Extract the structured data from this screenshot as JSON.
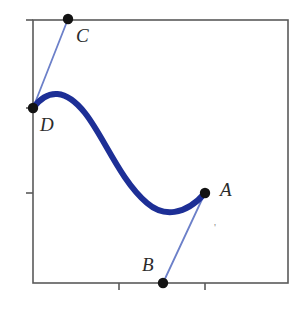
{
  "figure": {
    "background_color": "#ffffff",
    "width": 301,
    "height": 313
  },
  "frame": {
    "name": "plot-frame",
    "left": 33,
    "top": 20,
    "right": 288,
    "bottom": 283,
    "stroke_color": "#5a5a5a",
    "stroke_width": 1.6
  },
  "axes": {
    "y_axis": {
      "label": "",
      "tick_length": 7,
      "tick_color": "#5a5a5a",
      "ticks": [
        {
          "name": "y-tick-top",
          "y": 20,
          "label": ""
        },
        {
          "name": "y-tick-mid",
          "y": 108,
          "label": ""
        },
        {
          "name": "y-tick-low",
          "y": 193,
          "label": ""
        }
      ]
    },
    "x_axis": {
      "label": "",
      "tick_length": 7,
      "tick_color": "#5a5a5a",
      "ticks": [
        {
          "name": "x-tick-left",
          "x": 119,
          "label": ""
        },
        {
          "name": "x-tick-right",
          "x": 205,
          "label": ""
        }
      ]
    }
  },
  "curve": {
    "name": "bezier-curve",
    "type": "cubic-bezier",
    "stroke_color": "#1d2f96",
    "stroke_width": 6.0,
    "start_point": "D",
    "end_point": "A",
    "path": "M 33,108 C 48,88 66,89 85,113 C 104,137 120,180 147,203 C 163,217 185,216 205,193"
  },
  "tangent_lines": [
    {
      "name": "tangent-line-cd",
      "from": "C",
      "to": "D",
      "stroke_color": "#6c80c9",
      "stroke_width": 1.8,
      "x1": 68,
      "y1": 19,
      "x2": 33,
      "y2": 108
    },
    {
      "name": "tangent-line-ba",
      "from": "B",
      "to": "A",
      "stroke_color": "#6c80c9",
      "stroke_width": 1.8,
      "x1": 163,
      "y1": 283,
      "x2": 205,
      "y2": 193
    }
  ],
  "points": [
    {
      "name": "control-point-c",
      "label": "C",
      "x": 68,
      "y": 19,
      "radius": 5.2,
      "color": "#131313",
      "label_x": 76,
      "label_y": 26
    },
    {
      "name": "control-point-d",
      "label": "D",
      "x": 33,
      "y": 108,
      "radius": 5.2,
      "color": "#131313",
      "label_x": 40,
      "label_y": 115
    },
    {
      "name": "control-point-a",
      "label": "A",
      "x": 205,
      "y": 193,
      "radius": 5.2,
      "color": "#131313",
      "label_x": 220,
      "label_y": 180
    },
    {
      "name": "control-point-b",
      "label": "B",
      "x": 163,
      "y": 283,
      "radius": 5.2,
      "color": "#131313",
      "label_x": 142,
      "label_y": 255
    }
  ],
  "stray_mark": {
    "name": "stray-tick-mark",
    "text": "'",
    "x": 214,
    "y": 222
  },
  "colors": {
    "curve_navy": "#1d2f96",
    "tangent_blue": "#6c80c9",
    "frame_gray": "#5a5a5a",
    "point_black": "#131313",
    "label_ink": "#2b2b2b"
  }
}
